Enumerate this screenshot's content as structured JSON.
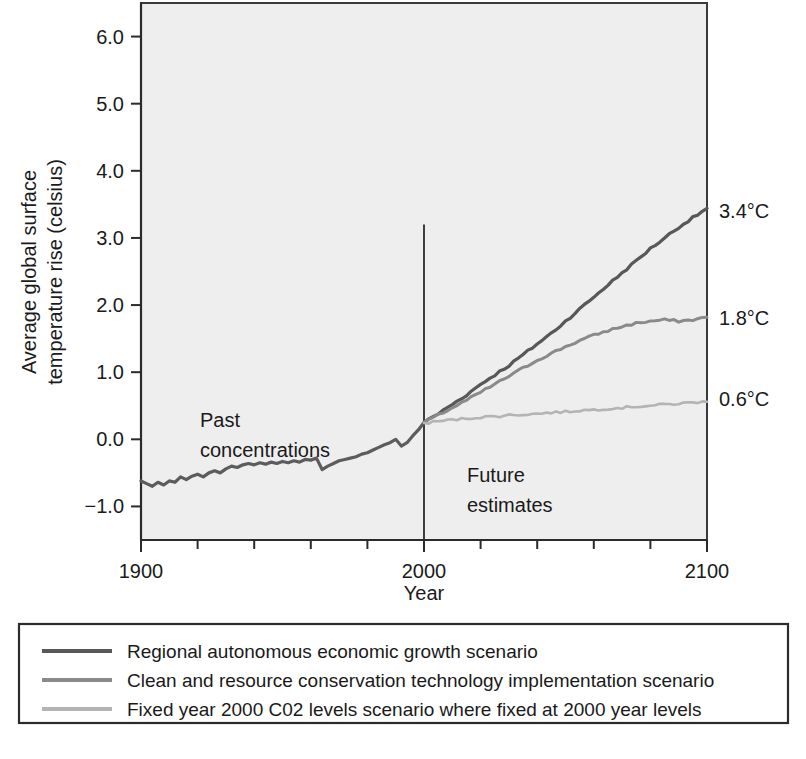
{
  "chart_data": {
    "type": "line",
    "title": "",
    "xlabel": "Year",
    "ylabel": "Average global surface temperature rise (celsius)",
    "ylabel_line1": "Average global surface",
    "ylabel_line2": "temperature rise (celsius)",
    "xlim": [
      1900,
      2100
    ],
    "ylim": [
      -1.5,
      6.5
    ],
    "grid": false,
    "legend_position": "below-plot",
    "x_tick_labels": [
      "1900",
      "2000",
      "2100"
    ],
    "x_tick_values": [
      1900,
      2000,
      2100
    ],
    "x_minor_ticks": [
      1920,
      1940,
      1960,
      1980,
      2020,
      2040,
      2060,
      2080
    ],
    "y_tick_labels": [
      "6.0",
      "5.0",
      "4.0",
      "3.0",
      "2.0",
      "1.0",
      "0.0",
      "−1.0"
    ],
    "y_tick_values": [
      6.0,
      5.0,
      4.0,
      3.0,
      2.0,
      1.0,
      0.0,
      -1.0
    ],
    "annotations": [
      {
        "name": "past-concentrations",
        "line1": "Past",
        "line2": "concentrations",
        "x": 1925,
        "y": 0.55
      },
      {
        "name": "future-estimates",
        "line1": "Future",
        "line2": "estimates",
        "x": 2022,
        "y": -0.3
      },
      {
        "name": "divider-label",
        "text": "",
        "x": 2000,
        "y": 3.2
      }
    ],
    "end_labels": [
      {
        "text": "3.4°C",
        "value": 3.4,
        "series": "regional"
      },
      {
        "text": "1.8°C",
        "value": 1.8,
        "series": "clean"
      },
      {
        "text": "0.6°C",
        "value": 0.6,
        "series": "fixed"
      }
    ],
    "divider_year": 2000,
    "divider_top_value": 3.2,
    "series": [
      {
        "name": "historical",
        "legend_hidden": true,
        "color": "#5c5c5c",
        "width": 3.2,
        "x": [
          1900,
          1902,
          1904,
          1906,
          1908,
          1910,
          1912,
          1914,
          1916,
          1918,
          1920,
          1922,
          1924,
          1926,
          1928,
          1930,
          1932,
          1934,
          1936,
          1938,
          1940,
          1942,
          1944,
          1946,
          1948,
          1950,
          1952,
          1954,
          1956,
          1958,
          1960,
          1962,
          1964,
          1966,
          1968,
          1970,
          1972,
          1974,
          1976,
          1978,
          1980,
          1982,
          1984,
          1986,
          1988,
          1990,
          1992,
          1994,
          1996,
          1998,
          2000
        ],
        "values": [
          -0.62,
          -0.66,
          -0.7,
          -0.64,
          -0.68,
          -0.62,
          -0.64,
          -0.56,
          -0.6,
          -0.55,
          -0.52,
          -0.56,
          -0.5,
          -0.47,
          -0.5,
          -0.44,
          -0.4,
          -0.42,
          -0.38,
          -0.36,
          -0.38,
          -0.35,
          -0.37,
          -0.34,
          -0.36,
          -0.33,
          -0.35,
          -0.32,
          -0.34,
          -0.3,
          -0.31,
          -0.28,
          -0.45,
          -0.4,
          -0.36,
          -0.32,
          -0.3,
          -0.28,
          -0.26,
          -0.22,
          -0.2,
          -0.16,
          -0.12,
          -0.08,
          -0.05,
          0.0,
          -0.1,
          -0.05,
          0.05,
          0.14,
          0.25
        ]
      },
      {
        "name": "regional",
        "label": "Regional autonomous economic growth scenario",
        "color": "#585858",
        "width": 3.2,
        "x": [
          2000,
          2005,
          2010,
          2015,
          2020,
          2025,
          2030,
          2035,
          2040,
          2045,
          2050,
          2055,
          2060,
          2065,
          2070,
          2075,
          2080,
          2085,
          2090,
          2095,
          2100
        ],
        "values": [
          0.25,
          0.38,
          0.52,
          0.66,
          0.82,
          0.96,
          1.1,
          1.26,
          1.42,
          1.58,
          1.76,
          1.94,
          2.12,
          2.3,
          2.48,
          2.66,
          2.84,
          3.0,
          3.16,
          3.3,
          3.44
        ]
      },
      {
        "name": "clean",
        "label": "Clean and resource conservation technology implementation scenario",
        "color": "#8a8a8a",
        "width": 3.0,
        "x": [
          2000,
          2005,
          2010,
          2015,
          2020,
          2025,
          2030,
          2035,
          2040,
          2045,
          2050,
          2055,
          2060,
          2065,
          2070,
          2075,
          2080,
          2085,
          2090,
          2095,
          2100
        ],
        "values": [
          0.25,
          0.36,
          0.47,
          0.58,
          0.7,
          0.82,
          0.94,
          1.06,
          1.18,
          1.28,
          1.38,
          1.47,
          1.55,
          1.62,
          1.68,
          1.73,
          1.76,
          1.78,
          1.76,
          1.78,
          1.82
        ]
      },
      {
        "name": "fixed",
        "label": "Fixed year 2000 C02 levels scenario where fixed at 2000 year levels",
        "color": "#b4b4b4",
        "width": 2.6,
        "x": [
          2000,
          2005,
          2010,
          2015,
          2020,
          2025,
          2030,
          2035,
          2040,
          2045,
          2050,
          2055,
          2060,
          2065,
          2070,
          2075,
          2080,
          2085,
          2090,
          2095,
          2100
        ],
        "values": [
          0.24,
          0.27,
          0.29,
          0.31,
          0.33,
          0.34,
          0.36,
          0.37,
          0.38,
          0.4,
          0.41,
          0.43,
          0.44,
          0.46,
          0.47,
          0.49,
          0.5,
          0.52,
          0.53,
          0.55,
          0.56
        ]
      }
    ]
  },
  "legend": {
    "items": [
      {
        "label": "Regional autonomous economic growth scenario",
        "color": "#585858"
      },
      {
        "label": "Clean and resource conservation technology implementation scenario",
        "color": "#8a8a8a"
      },
      {
        "label": "Fixed year 2000 C02 levels scenario where fixed at 2000 year levels",
        "color": "#b4b4b4"
      }
    ]
  },
  "colors": {
    "plot_background": "#eeeeee",
    "page_background": "#ffffff",
    "axis": "#2b2b2b",
    "text": "#1a1a1a"
  }
}
